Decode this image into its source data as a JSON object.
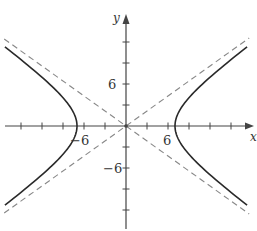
{
  "chart_data": {
    "type": "line",
    "title": "",
    "xlabel": "x",
    "ylabel": "y",
    "equation": "x^2/49 - y^2/25 = 1",
    "xlim": [
      -17.5,
      18
    ],
    "ylim": [
      -15,
      17.5
    ],
    "grid": false,
    "legend": null,
    "x_ticks": [
      -15,
      -12,
      -9,
      -6,
      -3,
      3,
      6,
      9,
      12,
      15
    ],
    "y_ticks": [
      -12,
      -9,
      -6,
      -3,
      3,
      6,
      9,
      12
    ],
    "x_tick_labels": [
      {
        "value": -6,
        "label": "−6"
      },
      {
        "value": 6,
        "label": "6"
      }
    ],
    "y_tick_labels": [
      {
        "value": 6,
        "label": "6"
      },
      {
        "value": -6,
        "label": "−6"
      }
    ],
    "series": [
      {
        "name": "hyperbola-right-branch",
        "style": "solid",
        "vertex": [
          7,
          0
        ]
      },
      {
        "name": "hyperbola-left-branch",
        "style": "solid",
        "vertex": [
          -7,
          0
        ]
      },
      {
        "name": "asymptote-positive",
        "style": "dashed",
        "equation": "y = (5/7)x"
      },
      {
        "name": "asymptote-negative",
        "style": "dashed",
        "equation": "y = -(5/7)x"
      }
    ]
  },
  "layout": {
    "origin_px": [
      126,
      126
    ],
    "px_per_unit": 7,
    "x_extent_units": [
      -17.4,
      17.6
    ],
    "colors": {
      "axis": "#444444",
      "curve": "#2a2a2a",
      "asymptote": "#888888",
      "text": "#333333"
    }
  },
  "labels": {
    "x_axis": "x",
    "y_axis": "y",
    "x_neg6": "−6",
    "x_pos6": "6",
    "y_pos6": "6",
    "y_neg6": "−6"
  }
}
